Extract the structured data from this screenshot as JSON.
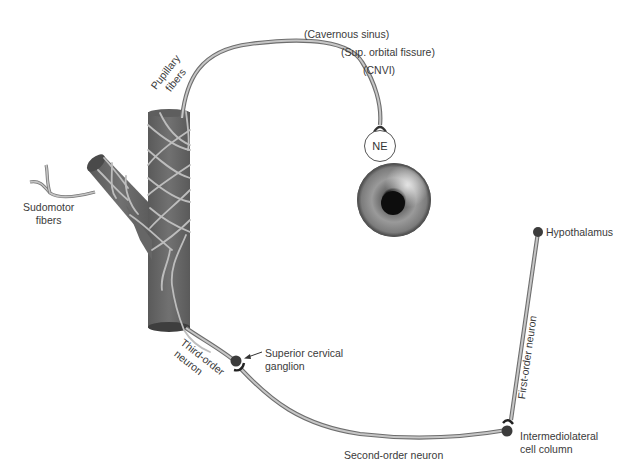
{
  "diagram": {
    "colors": {
      "artery": "#6b6b6b",
      "artery_dark": "#4a4a4a",
      "nerve_fill": "#bdbdbd",
      "nerve_edge": "#6e6e6e",
      "neuron_body": "#3c3c3c",
      "text": "#3a3a3a"
    },
    "labels": {
      "cavernous_sinus": "(Cavernous sinus)",
      "sup_orbital_fissure": "(Sup. orbital fissure)",
      "cnvi": "(CNVI)",
      "pupillary_fibers_line1": "Pupillary",
      "pupillary_fibers_line2": "fibers",
      "ne": "NE",
      "sudomotor_line1": "Sudomotor",
      "sudomotor_line2": "fibers",
      "hypothalamus": "Hypothalamus",
      "first_order": "First-order neuron",
      "third_order_line1": "Third-order",
      "third_order_line2": "neuron",
      "superior_cervical_line1": "Superior cervical",
      "superior_cervical_line2": "ganglion",
      "second_order": "Second-order neuron",
      "intermediolateral_line1": "Intermediolateral",
      "intermediolateral_line2": "cell column"
    }
  }
}
